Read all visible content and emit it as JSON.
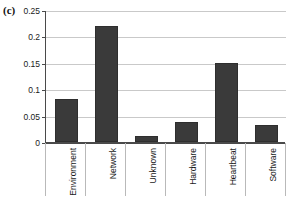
{
  "figure": {
    "panel_label": "(c)"
  },
  "chart_data": {
    "type": "bar",
    "title": "",
    "xlabel": "",
    "ylabel": "",
    "categories": [
      "Environment",
      "Network",
      "Unknown",
      "Hardware",
      "Heartbeat",
      "Software"
    ],
    "values": [
      0.081,
      0.22,
      0.011,
      0.037,
      0.15,
      0.032
    ],
    "ylim": [
      0,
      0.25
    ],
    "yticks": [
      0,
      0.05,
      0.1,
      0.15,
      0.2,
      0.25
    ],
    "ytick_labels": [
      "0",
      "0.05",
      "0.1",
      "0.15",
      "0.2",
      "0.25"
    ],
    "grid": true,
    "legend": "none",
    "bar_color": "#3a3a3a",
    "grid_color": "#c9c9c9",
    "axis_color": "#4a4a4a"
  }
}
